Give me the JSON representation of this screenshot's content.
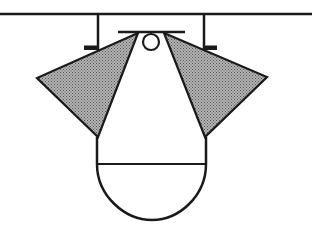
{
  "diagram": {
    "title": "",
    "colors": {
      "stroke": "#1a1a1a",
      "fill_shaded": "#8c8c8c",
      "background": "#ffffff"
    },
    "elements": [
      {
        "name": "ceiling-line",
        "type": "line"
      },
      {
        "name": "left-hanger",
        "type": "line"
      },
      {
        "name": "right-hanger",
        "type": "line"
      },
      {
        "name": "left-bracket",
        "type": "rect"
      },
      {
        "name": "right-bracket",
        "type": "rect"
      },
      {
        "name": "top-bar",
        "type": "line"
      },
      {
        "name": "pivot-circle",
        "type": "circle"
      },
      {
        "name": "left-wing",
        "type": "polygon",
        "fill": "hatched"
      },
      {
        "name": "right-wing",
        "type": "polygon",
        "fill": "hatched"
      },
      {
        "name": "body-shape",
        "type": "path"
      },
      {
        "name": "body-divider",
        "type": "line"
      }
    ]
  }
}
